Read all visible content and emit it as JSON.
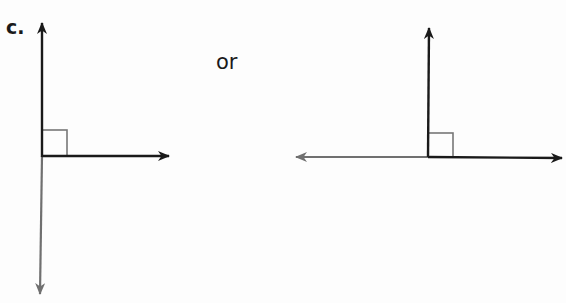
{
  "labels": {
    "part": "c.",
    "connector": "or"
  },
  "figures": [
    {
      "id": "left",
      "description": "Right angle: ray up and ray right; opposite ray downward shown in gray",
      "vertex": [
        42,
        156
      ],
      "rays": [
        {
          "direction": "up",
          "end": [
            42,
            22
          ],
          "color": "#1a1a1a"
        },
        {
          "direction": "right",
          "end": [
            170,
            156
          ],
          "color": "#1a1a1a"
        },
        {
          "direction": "down",
          "end": [
            40,
            295
          ],
          "color": "#707070"
        }
      ],
      "right_angle_marker": {
        "x": 42,
        "y": 130,
        "size": 25,
        "color": "#777777"
      }
    },
    {
      "id": "right",
      "description": "Right angle: ray up and ray right; opposite ray leftward shown in gray",
      "vertex": [
        428,
        157
      ],
      "rays": [
        {
          "direction": "up",
          "end": [
            429,
            27
          ],
          "color": "#1a1a1a"
        },
        {
          "direction": "right",
          "end": [
            563,
            158
          ],
          "color": "#1a1a1a"
        },
        {
          "direction": "left",
          "end": [
            295,
            157
          ],
          "color": "#707070"
        }
      ],
      "right_angle_marker": {
        "x": 428,
        "y": 133,
        "size": 25,
        "color": "#777777"
      }
    }
  ],
  "colors": {
    "dark_ray": "#1a1a1a",
    "gray_ray": "#707070",
    "marker": "#777777"
  }
}
